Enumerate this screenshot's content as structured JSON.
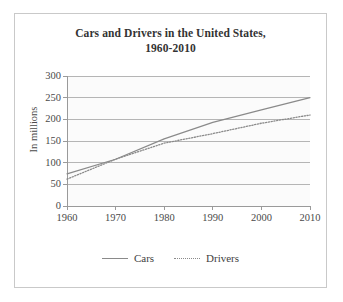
{
  "chart_data": {
    "type": "line",
    "title": "Cars and Drivers in the United States, 1960-2010",
    "title_line1": "Cars and Drivers in the United States,",
    "title_line2": "1960-2010",
    "xlabel": "",
    "ylabel": "In millions",
    "x": [
      1960,
      1970,
      1980,
      1990,
      2000,
      2010
    ],
    "xtick_labels": [
      "1960",
      "1970",
      "1980",
      "1990",
      "2000",
      "2010"
    ],
    "ytick_labels": [
      "0",
      "50",
      "100",
      "150",
      "200",
      "250",
      "300"
    ],
    "yticks": [
      0,
      50,
      100,
      150,
      200,
      250,
      300
    ],
    "ylim": [
      0,
      300
    ],
    "xlim": [
      1960,
      2010
    ],
    "grid": true,
    "grid_axis": "y",
    "legend_position": "bottom",
    "series": [
      {
        "name": "Cars",
        "style": "solid",
        "color": "#8a8a8a",
        "values": [
          74,
          108,
          155,
          193,
          222,
          250
        ]
      },
      {
        "name": "Drivers",
        "style": "dotted",
        "color": "#8a8a8a",
        "values": [
          62,
          108,
          145,
          167,
          191,
          210
        ]
      }
    ]
  },
  "colors": {
    "grid": "#b5b5b5",
    "axis": "#9a9a9a",
    "plot_background": "#fbfbfb",
    "card_border": "#c9c9c9",
    "text": "#3a3a3a"
  }
}
